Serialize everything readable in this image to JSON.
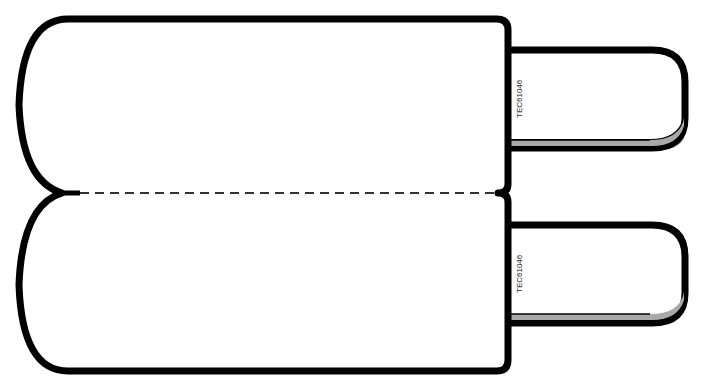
{
  "diagram": {
    "stroke_color": "#000000",
    "fill_color": "#ffffff",
    "shadow_color": "#a9a9a9",
    "prongs": [
      {
        "label": "TEC61046"
      },
      {
        "label": "TEC61046"
      }
    ]
  }
}
